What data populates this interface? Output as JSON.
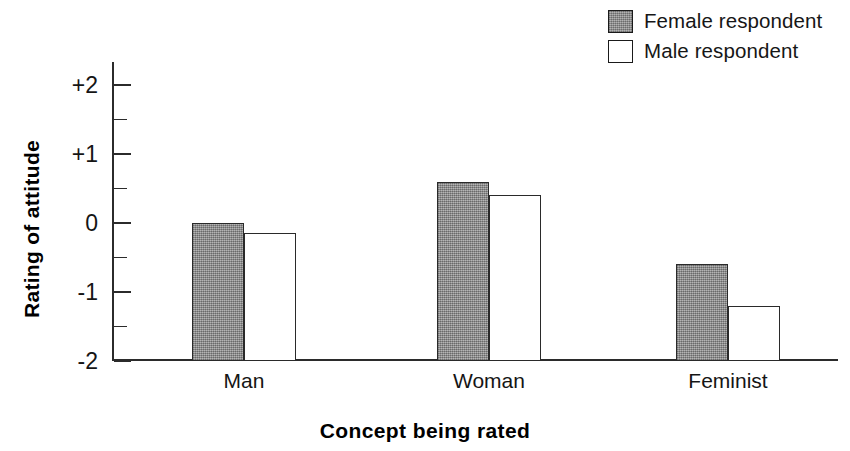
{
  "chart_data": {
    "type": "bar",
    "title": "",
    "xlabel": "Concept being rated",
    "ylabel": "Rating of attitude",
    "categories": [
      "Man",
      "Woman",
      "Feminist"
    ],
    "series": [
      {
        "name": "Female respondent",
        "values": [
          0.0,
          0.6,
          -0.6
        ],
        "fill": "#969696",
        "swatch": "gray-filled-square"
      },
      {
        "name": "Male respondent",
        "values": [
          -0.15,
          0.4,
          -1.2
        ],
        "fill": "#ffffff",
        "swatch": "white-square"
      }
    ],
    "ylim": [
      -2,
      2
    ],
    "ytick_labels": [
      "+2",
      "+1",
      "0",
      "-1",
      "-2"
    ],
    "ytick_values": [
      2,
      1,
      0,
      -1,
      -2
    ],
    "yminor_tick_values": [
      1.5,
      0.5,
      -0.5,
      -1.5
    ],
    "grid": false,
    "legend_position": "top-right",
    "baseline_value": -2
  },
  "legend": {
    "items": [
      {
        "label": "Female respondent",
        "swatch": "female"
      },
      {
        "label": "Male respondent",
        "swatch": "male"
      }
    ]
  },
  "axes": {
    "y_title": "Rating of attitude",
    "x_title": "Concept being rated",
    "y_ticks": [
      {
        "label": "+2",
        "value": 2
      },
      {
        "label": "+1",
        "value": 1
      },
      {
        "label": "0",
        "value": 0
      },
      {
        "label": "-1",
        "value": -1
      },
      {
        "label": "-2",
        "value": -2
      }
    ],
    "x_categories": [
      "Man",
      "Woman",
      "Feminist"
    ]
  }
}
